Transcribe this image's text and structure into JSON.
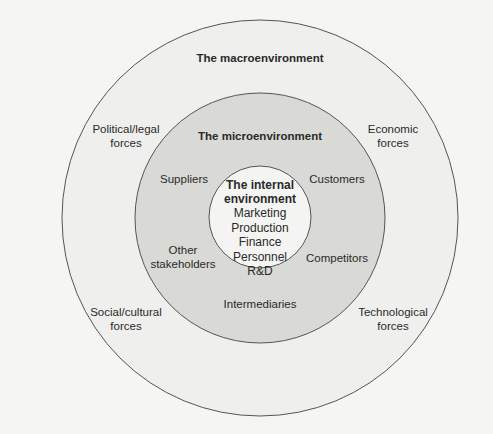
{
  "diagram": {
    "colors": {
      "background": "#f5f5f4",
      "outer_ring_fill": "#efefed",
      "middle_ring_fill": "#d9d9d6",
      "inner_circle_fill": "#f4f4f2",
      "stroke": "#555555"
    },
    "macroenvironment": {
      "title": "The macroenvironment",
      "forces": [
        {
          "line1": "Political/legal",
          "line2": "forces"
        },
        {
          "line1": "Economic",
          "line2": "forces"
        },
        {
          "line1": "Social/cultural",
          "line2": "forces"
        },
        {
          "line1": "Technological",
          "line2": "forces"
        }
      ]
    },
    "microenvironment": {
      "title": "The microenvironment",
      "actors": {
        "suppliers": "Suppliers",
        "customers": "Customers",
        "other_stakeholders_1": "Other",
        "other_stakeholders_2": "stakeholders",
        "competitors": "Competitors",
        "intermediaries": "Intermediaries"
      }
    },
    "internal_environment": {
      "title_line1": "The internal",
      "title_line2": "environment",
      "functions": [
        "Marketing",
        "Production",
        "Finance",
        "Personnel",
        "R&D"
      ]
    }
  }
}
